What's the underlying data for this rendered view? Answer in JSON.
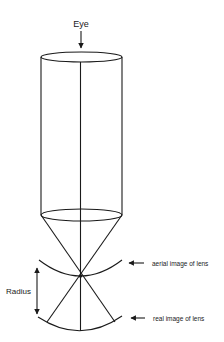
{
  "diagram": {
    "type": "optics-schematic",
    "labels": {
      "eye": "Eye",
      "radius": "Radius",
      "aerial_image": "aerial image of lens",
      "real_image": "real image of lens"
    },
    "components": [
      {
        "name": "cylinder-tube",
        "description": "vertical cylinder viewed from top by the eye"
      },
      {
        "name": "cone",
        "description": "rays converging from cylinder base to focal point"
      },
      {
        "name": "focal-point",
        "description": "crossing point of rays"
      },
      {
        "name": "aerial-image-arc",
        "description": "curved arc through focal point"
      },
      {
        "name": "real-image-arc",
        "description": "curved arc below focal point"
      },
      {
        "name": "radius-arrow",
        "description": "double-headed vertical arrow spanning the two arcs"
      }
    ],
    "colors": {
      "stroke": "#1a1a1a",
      "background": "#ffffff"
    }
  }
}
